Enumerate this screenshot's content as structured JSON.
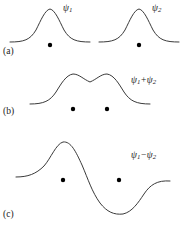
{
  "figure": {
    "width": 184,
    "height": 232,
    "background_color": "#ffffff",
    "curve_color": "#3a3a3a",
    "curve_width": 1.0,
    "nucleus_color": "#000000",
    "nucleus_radius": 2.2
  },
  "panels": [
    {
      "id": "a",
      "label": "(a)",
      "description": "Two separate atomic wavefunctions, each a single bell-shaped hump centered on its own nucleus",
      "curves": [
        {
          "name": "psi1-curve",
          "label_plain": "psi_1",
          "label_symbol": "ψ",
          "label_subscript": "1",
          "baseline_y": 41,
          "peak_x": 50,
          "peak_y": 9
        },
        {
          "name": "psi2-curve",
          "label_plain": "psi_2",
          "label_symbol": "ψ",
          "label_subscript": "2",
          "baseline_y": 41,
          "peak_x": 139,
          "peak_y": 9
        }
      ],
      "nuclei": [
        {
          "x": 50,
          "y": 45
        },
        {
          "x": 139,
          "y": 45
        }
      ]
    },
    {
      "id": "b",
      "label": "(b)",
      "description": "Symmetric (bonding) combination: two humps merged with a shallow dip between the nuclei, amplitude everywhere positive",
      "curves": [
        {
          "name": "psi-sum-curve",
          "label_plain": "psi_1 + psi_2",
          "label_symbol": "ψ",
          "label_subscript_first": "1",
          "label_operator": "+",
          "label_subscript_second": "2",
          "baseline_y": 103,
          "peak_left_x": 73,
          "peak_right_x": 107,
          "peak_y": 74,
          "saddle_x": 90,
          "saddle_y": 82
        }
      ],
      "nuclei": [
        {
          "x": 73,
          "y": 109
        },
        {
          "x": 107,
          "y": 109
        }
      ]
    },
    {
      "id": "c",
      "label": "(c)",
      "description": "Antisymmetric (antibonding) combination: positive lobe over the left nucleus, node between the nuclei, negative lobe over the right nucleus",
      "curves": [
        {
          "name": "psi-difference-curve",
          "label_plain": "psi_1 - psi_2",
          "label_symbol": "ψ",
          "label_subscript_first": "1",
          "label_operator": "−",
          "label_subscript_second": "2",
          "baseline_y": 176,
          "crest_x": 63,
          "crest_y": 142,
          "node_x": 95,
          "trough_x": 123,
          "trough_y": 214
        }
      ],
      "nuclei": [
        {
          "x": 63,
          "y": 180
        },
        {
          "x": 119,
          "y": 180
        }
      ]
    }
  ],
  "labels": {
    "panel_a": "(a)",
    "panel_b": "(b)",
    "panel_c": "(c)",
    "psi": "ψ",
    "sub_1": "1",
    "sub_2": "2",
    "plus": "+",
    "minus": "−"
  }
}
